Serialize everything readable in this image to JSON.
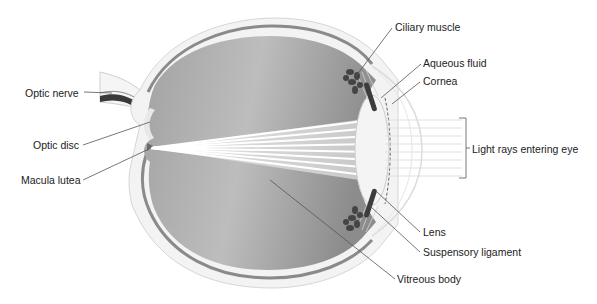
{
  "diagram": {
    "labels": {
      "optic_nerve": "Optic nerve",
      "optic_disc": "Optic disc",
      "macula_lutea": "Macula lutea",
      "ciliary_muscle": "Ciliary muscle",
      "aqueous_fluid": "Aqueous fluid",
      "cornea": "Cornea",
      "light_rays": "Light rays entering eye",
      "lens": "Lens",
      "suspensory_ligament": "Suspensory ligament",
      "vitreous_body": "Vitreous body"
    },
    "colors": {
      "sclera": "#f3f3f3",
      "choroid": "#8a8a8a",
      "vitreous_dark": "#8f8f8f",
      "vitreous_light": "#d8d8d8",
      "lens": "#f4f4f4",
      "ciliary": "#444444",
      "leader_line": "#555555",
      "text": "#222222"
    }
  }
}
